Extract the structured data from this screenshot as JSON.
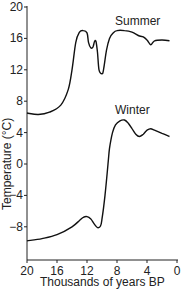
{
  "chart_data": {
    "type": "line",
    "title": "",
    "xlabel": "Thousands of years BP",
    "ylabel": "Temperature (°C)",
    "x_ticks": [
      20,
      16,
      12,
      8,
      4,
      0
    ],
    "y_ticks": [
      20,
      16,
      12,
      8,
      4,
      0,
      -4,
      -8
    ],
    "xlim": [
      20,
      0
    ],
    "ylim": [
      -12,
      20
    ],
    "grid": false,
    "series": [
      {
        "name": "Summer",
        "x": [
          20,
          18.5,
          17,
          15.5,
          14.5,
          14,
          13.5,
          13,
          12.5,
          12,
          11.8,
          11.5,
          11.2,
          11,
          10.8,
          10.6,
          10.4,
          10,
          9.8,
          9.4,
          9,
          8.5,
          8,
          7,
          6,
          5,
          4.5,
          4,
          3.5,
          3,
          2,
          1
        ],
        "y": [
          6.5,
          6.3,
          6.6,
          7.5,
          9.5,
          12,
          15.5,
          16.8,
          17,
          16.7,
          15.5,
          14.8,
          14.9,
          15.6,
          15.6,
          14.2,
          12,
          11.5,
          12,
          14.5,
          16,
          16.7,
          17,
          17,
          16.8,
          16.3,
          16.2,
          15.8,
          15.2,
          15.7,
          15.8,
          15.7
        ]
      },
      {
        "name": "Winter",
        "x": [
          20,
          18,
          16,
          14,
          13,
          12.5,
          12,
          11.5,
          11,
          10.6,
          10.2,
          10,
          9.6,
          9.2,
          9,
          8.6,
          8.2,
          7.6,
          7,
          6.5,
          6,
          5.5,
          5,
          4.5,
          4,
          3.5,
          3,
          2,
          1
        ],
        "y": [
          -9.8,
          -9.5,
          -9,
          -8,
          -7.2,
          -6.8,
          -6.7,
          -7,
          -7.7,
          -8.1,
          -7.9,
          -7,
          -4,
          0,
          2,
          4,
          5,
          5.5,
          5.6,
          5.2,
          4.5,
          3.8,
          3.5,
          3.8,
          4.3,
          4.5,
          4.3,
          3.9,
          3.5
        ]
      }
    ],
    "annotations": [
      "Summer",
      "Winter"
    ],
    "legend": "inline labels above each curve"
  },
  "labels": {
    "summer": "Summer",
    "winter": "Winter",
    "xlabel": "Thousands of years BP",
    "ylabel": "Temperature (°C)",
    "y_ticks": [
      "20",
      "16",
      "12",
      "8",
      "4",
      "0",
      "−4",
      "−8"
    ],
    "x_ticks": [
      "20",
      "16",
      "12",
      "8",
      "4",
      "0"
    ]
  }
}
